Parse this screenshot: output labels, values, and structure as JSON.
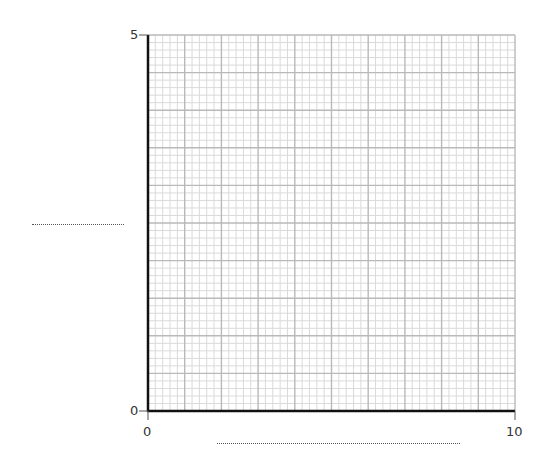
{
  "chart_data": {
    "type": "scatter",
    "title": "",
    "xlabel": "",
    "ylabel": "",
    "x_ticks": [
      "0",
      "10"
    ],
    "y_ticks": [
      "0",
      "5"
    ],
    "xlim": [
      0,
      10
    ],
    "ylim": [
      0,
      5
    ],
    "grid": {
      "on": true,
      "x_major_step": 1,
      "x_minor_step": 0.2,
      "y_major_step": 0.5,
      "y_minor_step": 0.1
    },
    "series": [],
    "annotations": [
      "blank dotted answer line for y-axis label",
      "blank dotted answer line for x-axis label"
    ]
  },
  "axes": {
    "x_min_label": "0",
    "x_max_label": "10",
    "y_min_label": "0",
    "y_max_label": "5"
  },
  "colors": {
    "minor_grid": "#dadada",
    "major_grid": "#b9b9b9",
    "axis": "#111111"
  }
}
